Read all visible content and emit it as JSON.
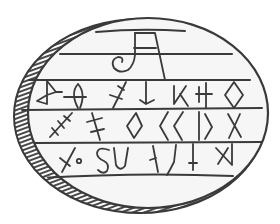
{
  "figure": {
    "subject": "Inscribed oval stone / amulet drawing with runic-style characters",
    "colors": {
      "background": "#ffffff",
      "ink": "#3a3a3a",
      "stone_fill": "#f6f6f6",
      "hatch": "#4a4a4a"
    },
    "rows": [
      {
        "name": "monogram-row",
        "glyphs": [
          "JA-monogram"
        ]
      },
      {
        "name": "row-1",
        "glyphs": [
          "bow-tie",
          "circle-bar",
          "x-cross",
          "arrow-down",
          "dagaz",
          "h-cross",
          "diamond"
        ]
      },
      {
        "name": "row-2",
        "glyphs": [
          "slash-ticks",
          "double-cross",
          "diamond",
          "angle-left",
          "angle-left",
          "bar-angle-right",
          "x"
        ]
      },
      {
        "name": "row-3",
        "glyphs": [
          "x-circle",
          "s",
          "u",
          "back-slash-hook",
          "slash-hook",
          "dagger",
          "a-rune"
        ]
      }
    ]
  }
}
